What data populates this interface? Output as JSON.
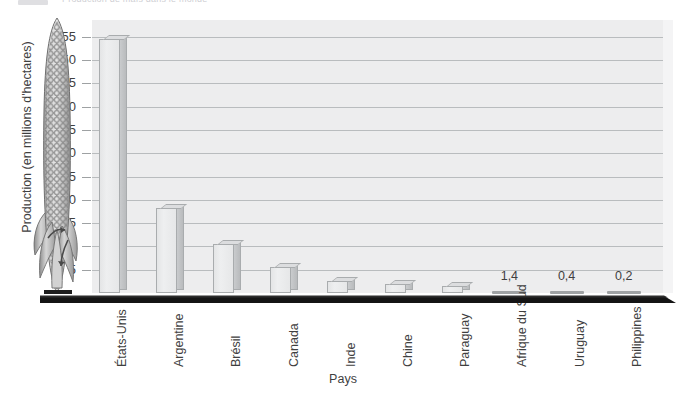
{
  "header": {
    "faint_title": "Production de maïs dans le monde"
  },
  "chart_data": {
    "type": "bar",
    "title": "",
    "xlabel": "Pays",
    "ylabel": "Production (en millions d'hectares)",
    "categories": [
      "États-Unis",
      "Argentine",
      "Brésil",
      "Canada",
      "Inde",
      "Chine",
      "Paraguay",
      "Afrique du Sud",
      "Uruguay",
      "Philippines"
    ],
    "values": [
      54.5,
      18.3,
      10.5,
      5.5,
      2.5,
      2.0,
      1.4,
      0.4,
      0.2,
      0.2
    ],
    "point_labels": [
      "",
      "",
      "",
      "",
      "",
      "",
      "",
      "1,4",
      "0,4",
      "0,2"
    ],
    "ylim": [
      0,
      57
    ],
    "yticks": [
      "5",
      "10",
      "15",
      "20",
      "25",
      "30",
      "35",
      "40",
      "45",
      "50",
      "55"
    ],
    "ytick_values": [
      5,
      10,
      15,
      20,
      25,
      30,
      35,
      40,
      45,
      50,
      55
    ],
    "grid": true,
    "legend": "none",
    "bar_style": "3d",
    "colors": {
      "bar_face": "#eeeff0",
      "bar_side": "#c2c4c6",
      "bar_outline": "#a9acae",
      "plot_background": "#ededee",
      "gridline": "#b9bcbe",
      "axis_line": "#111111",
      "text": "#3f3f3f"
    }
  },
  "illustration": {
    "name": "corn-cob-illustration",
    "description": "Épi de maïs"
  }
}
